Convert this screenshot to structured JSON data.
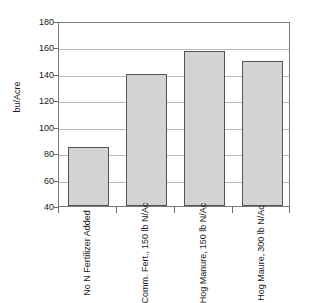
{
  "chart_data": {
    "type": "bar",
    "title": "",
    "xlabel": "",
    "ylabel": "bu/Acre",
    "ylim": [
      40,
      180
    ],
    "yticks": [
      40,
      60,
      80,
      100,
      120,
      140,
      160,
      180
    ],
    "grid": true,
    "legend": false,
    "categories": [
      "No N Fertilizer Added",
      "Comm. Fert., 150 lb N/Ac",
      "Hog Manure, 150 lb N/Ac",
      "Hog Maure, 300 lb N/Ac"
    ],
    "category_lines": [
      [
        "No N Fertilizer",
        "Added"
      ],
      [
        "Comm. Fert.,",
        "150 lb N/Ac"
      ],
      [
        "Hog Manure,",
        "150 lb N/Ac"
      ],
      [
        "Hog Maure,",
        "300 lb N/Ac"
      ]
    ],
    "values": [
      85,
      140,
      157,
      150
    ],
    "bar_color": "#d3d3d3",
    "bar_border_color": "#555555",
    "grid_color": "#b9b9b9",
    "axis_color": "#7a7a7a",
    "text_color": "#1a1a1a",
    "background": "#ffffff"
  }
}
